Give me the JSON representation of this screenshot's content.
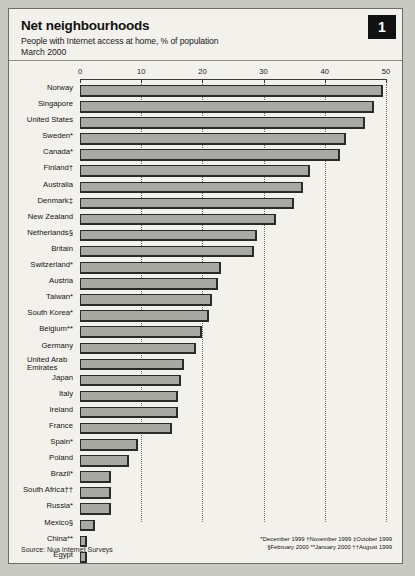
{
  "badge": {
    "number": "1"
  },
  "header": {
    "title": "Net neighbourhoods",
    "subtitle": "People with Internet access at home, % of population",
    "date": "March 2000"
  },
  "source": "Source: Nua Internet Surveys",
  "footnotes": {
    "line1": "*December 1999  †November 1999  ‡October 1999",
    "line2": "§February 2000  **January 2000  ††August 1999"
  },
  "chart_data": {
    "type": "bar",
    "orientation": "horizontal",
    "title": "Net neighbourhoods",
    "subtitle": "People with Internet access at home, % of population",
    "period": "March 2000",
    "xlabel": "",
    "ylabel": "",
    "xlim": [
      0,
      50
    ],
    "xticks": [
      0,
      10,
      20,
      30,
      40,
      50
    ],
    "grid": true,
    "legend": "none",
    "categories": [
      "Norway",
      "Singapore",
      "United States",
      "Sweden*",
      "Canada*",
      "Finland†",
      "Australia",
      "Denmark‡",
      "New Zealand",
      "Netherlands§",
      "Britain",
      "Switzerland*",
      "Austria",
      "Taiwan*",
      "South Korea*",
      "Belgium**",
      "Germany",
      "United Arab Emirates",
      "Japan",
      "Italy",
      "Ireland",
      "France",
      "Spain*",
      "Poland",
      "Brazil*",
      "South Africa††",
      "Russia*",
      "Mexico§",
      "China**",
      "Egypt",
      "India"
    ],
    "values": [
      49.5,
      48.0,
      46.5,
      43.5,
      42.5,
      37.5,
      36.5,
      35.0,
      32.0,
      29.0,
      28.5,
      23.0,
      22.5,
      21.5,
      21.0,
      20.0,
      19.0,
      17.0,
      16.5,
      16.0,
      16.0,
      15.0,
      9.5,
      8.0,
      5.0,
      5.0,
      5.0,
      2.5,
      1.2,
      1.2,
      0.8
    ]
  }
}
